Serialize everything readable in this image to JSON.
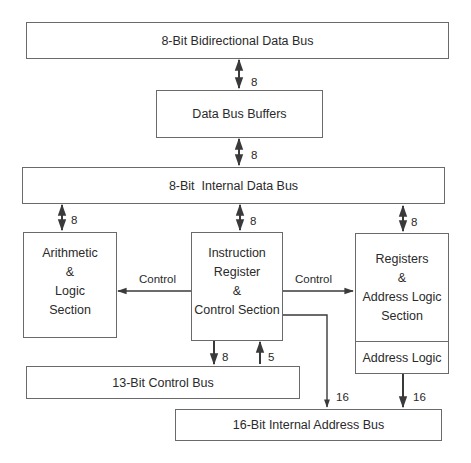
{
  "diagram": {
    "blocks": {
      "bidirectional_data_bus": "8-Bit Bidirectional Data Bus",
      "data_bus_buffers": "Data Bus Buffers",
      "internal_data_bus": "8-Bit  Internal Data Bus",
      "alu": [
        "Arithmetic",
        "&",
        "Logic",
        "Section"
      ],
      "control_section": [
        "Instruction",
        "Register",
        "&",
        "Control Section"
      ],
      "registers": [
        "Registers",
        "&",
        "Address Logic",
        "Section"
      ],
      "address_logic": "Address Logic",
      "control_bus": "13-Bit Control Bus",
      "address_bus": "16-Bit Internal Address Bus"
    },
    "labels": {
      "ext_to_buffers": "8",
      "buffers_to_internal": "8",
      "internal_to_alu": "8",
      "internal_to_control": "8",
      "internal_to_registers": "8",
      "control_to_alu": "Control",
      "control_to_registers": "Control",
      "control_to_bus_out": "8",
      "bus_to_control_in": "5",
      "control_to_address_bus": "16",
      "address_logic_to_address_bus": "16"
    },
    "colors": {
      "line": "#3a3a3a",
      "border": "#6a6a6a",
      "text": "#2a2a2a"
    }
  }
}
